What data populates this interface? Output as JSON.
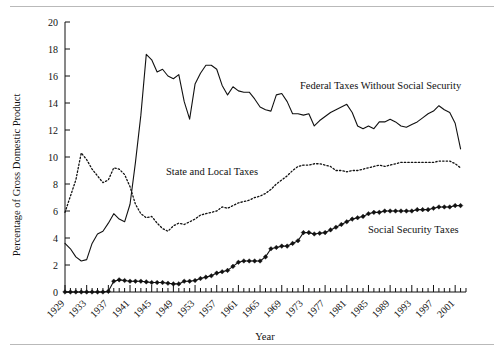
{
  "figure": {
    "background_color": "#ffffff",
    "rule_color": "#b9b9b9",
    "line_color": "#111111"
  },
  "chart_data": {
    "type": "line",
    "title": "",
    "subtitle": "",
    "xlabel": "Year",
    "ylabel": "Percentage of Gross Domestic Product",
    "xlim": [
      1929,
      2003
    ],
    "ylim": [
      0,
      20
    ],
    "yticks": [
      0,
      2,
      4,
      6,
      8,
      10,
      12,
      14,
      16,
      18,
      20
    ],
    "ytick_labels": [
      "0",
      "2",
      "4",
      "6",
      "8",
      "10",
      "12",
      "14",
      "16",
      "18",
      "20"
    ],
    "xticks": [
      1929,
      1933,
      1937,
      1941,
      1945,
      1949,
      1953,
      1957,
      1961,
      1965,
      1969,
      1973,
      1977,
      1981,
      1985,
      1989,
      1993,
      1997,
      2001
    ],
    "xtick_labels": [
      "1929",
      "1933",
      "1937",
      "1941",
      "1945",
      "1949",
      "1953",
      "1957",
      "1961",
      "1965",
      "1969",
      "1973",
      "1977",
      "1981",
      "1985",
      "1989",
      "1993",
      "1997",
      "2001"
    ],
    "xtick_minor_step": 1,
    "grid": false,
    "legend": "inline-annotations",
    "x": [
      1929,
      1930,
      1931,
      1932,
      1933,
      1934,
      1935,
      1936,
      1937,
      1938,
      1939,
      1940,
      1941,
      1942,
      1943,
      1944,
      1945,
      1946,
      1947,
      1948,
      1949,
      1950,
      1951,
      1952,
      1953,
      1954,
      1955,
      1956,
      1957,
      1958,
      1959,
      1960,
      1961,
      1962,
      1963,
      1964,
      1965,
      1966,
      1967,
      1968,
      1969,
      1970,
      1971,
      1972,
      1973,
      1974,
      1975,
      1976,
      1977,
      1978,
      1979,
      1980,
      1981,
      1982,
      1983,
      1984,
      1985,
      1986,
      1987,
      1988,
      1989,
      1990,
      1991,
      1992,
      1993,
      1994,
      1995,
      1996,
      1997,
      1998,
      1999,
      2000,
      2001,
      2002
    ],
    "series": [
      {
        "name": "Federal Taxes Without Social Security",
        "style": "solid",
        "marker": "none",
        "label_position": "upper-right",
        "values": [
          3.6,
          3.2,
          2.6,
          2.3,
          2.4,
          3.6,
          4.3,
          4.5,
          5.1,
          5.8,
          5.4,
          5.2,
          6.5,
          9.6,
          13.1,
          17.6,
          17.2,
          16.3,
          16.5,
          16.0,
          15.8,
          16.1,
          14.1,
          12.8,
          15.4,
          16.2,
          16.8,
          16.8,
          16.5,
          15.3,
          14.6,
          15.2,
          14.9,
          14.8,
          14.8,
          14.3,
          13.7,
          13.5,
          13.4,
          14.6,
          14.7,
          14.1,
          13.2,
          13.2,
          13.1,
          13.2,
          12.3,
          12.7,
          13.0,
          13.3,
          13.5,
          13.7,
          13.9,
          13.3,
          12.3,
          12.1,
          12.3,
          12.1,
          12.6,
          12.6,
          12.8,
          12.6,
          12.3,
          12.2,
          12.4,
          12.6,
          12.9,
          13.2,
          13.4,
          13.8,
          13.5,
          13.3,
          12.5,
          10.6
        ]
      },
      {
        "name": "State and Local Taxes",
        "style": "dotted",
        "marker": "none",
        "label_position": "center-left",
        "values": [
          5.9,
          7.1,
          8.3,
          10.3,
          9.8,
          9.1,
          8.6,
          8.1,
          8.3,
          9.2,
          9.1,
          8.7,
          7.8,
          6.5,
          5.8,
          5.5,
          5.6,
          5.1,
          4.7,
          4.5,
          4.9,
          5.1,
          5.0,
          5.2,
          5.4,
          5.7,
          5.8,
          5.9,
          6.0,
          6.3,
          6.2,
          6.4,
          6.6,
          6.7,
          6.8,
          7.0,
          7.1,
          7.3,
          7.6,
          8.0,
          8.3,
          8.6,
          9.0,
          9.3,
          9.4,
          9.4,
          9.5,
          9.5,
          9.4,
          9.3,
          9.0,
          9.0,
          8.9,
          9.0,
          9.0,
          9.1,
          9.2,
          9.3,
          9.4,
          9.3,
          9.4,
          9.5,
          9.6,
          9.6,
          9.6,
          9.6,
          9.6,
          9.6,
          9.6,
          9.7,
          9.7,
          9.7,
          9.5,
          9.2
        ]
      },
      {
        "name": "Social Security Taxes",
        "style": "solid",
        "marker": "diamond",
        "label_position": "lower-right",
        "values": [
          0.0,
          0.0,
          0.0,
          0.0,
          0.0,
          0.0,
          0.0,
          0.0,
          0.05,
          0.8,
          0.9,
          0.85,
          0.8,
          0.8,
          0.8,
          0.75,
          0.7,
          0.7,
          0.7,
          0.65,
          0.6,
          0.6,
          0.8,
          0.8,
          0.85,
          1.0,
          1.1,
          1.2,
          1.4,
          1.5,
          1.6,
          1.9,
          2.2,
          2.3,
          2.3,
          2.3,
          2.3,
          2.6,
          3.2,
          3.3,
          3.4,
          3.4,
          3.6,
          3.8,
          4.4,
          4.4,
          4.3,
          4.35,
          4.4,
          4.6,
          4.8,
          5.0,
          5.2,
          5.4,
          5.5,
          5.6,
          5.8,
          5.9,
          5.9,
          6.0,
          6.0,
          6.0,
          6.0,
          6.0,
          6.0,
          6.1,
          6.1,
          6.1,
          6.2,
          6.3,
          6.3,
          6.3,
          6.4,
          6.4
        ]
      }
    ],
    "annotations": [
      {
        "text": "Federal Taxes Without Social Security",
        "x_px": 300,
        "y_px": 89
      },
      {
        "text": "State and Local Taxes",
        "x_px": 166,
        "y_px": 175
      },
      {
        "text": "Social Security Taxes",
        "x_px": 368,
        "y_px": 233
      }
    ]
  }
}
